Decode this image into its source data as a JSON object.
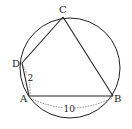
{
  "diagram": {
    "type": "inscribed-quadrilateral-in-circle",
    "circle": {
      "cx": 70,
      "cy": 68,
      "r": 50,
      "stroke": "#222222"
    },
    "points": {
      "A": {
        "label": "A",
        "x": 29,
        "y": 96
      },
      "B": {
        "label": "B",
        "x": 113,
        "y": 96
      },
      "C": {
        "label": "C",
        "x": 63,
        "y": 17
      },
      "D": {
        "label": "D",
        "x": 22,
        "y": 63
      }
    },
    "segments": [
      "AB",
      "BC",
      "CD",
      "DA"
    ],
    "measurements": {
      "AD": {
        "label": "2"
      },
      "AB": {
        "label": "10"
      }
    }
  }
}
